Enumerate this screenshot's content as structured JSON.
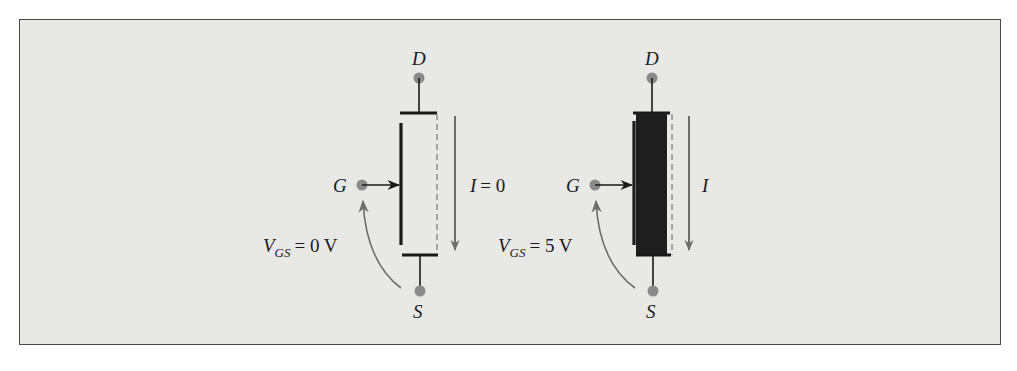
{
  "figure": {
    "background_color": "#e8e8e6",
    "terminal_dot_color": "#8a8a8a",
    "line_color": "#1a1a1a",
    "channel_fill_color": "#1e1e1e"
  },
  "left_transistor": {
    "state": "off",
    "drain_label": "D",
    "gate_label": "G",
    "source_label": "S",
    "current_label": "I",
    "current_value": "= 0",
    "vgs_symbol": "V",
    "vgs_subscript": "GS",
    "vgs_value": "= 0 V"
  },
  "right_transistor": {
    "state": "on",
    "drain_label": "D",
    "gate_label": "G",
    "source_label": "S",
    "current_label": "I",
    "vgs_symbol": "V",
    "vgs_subscript": "GS",
    "vgs_value": "= 5 V"
  }
}
